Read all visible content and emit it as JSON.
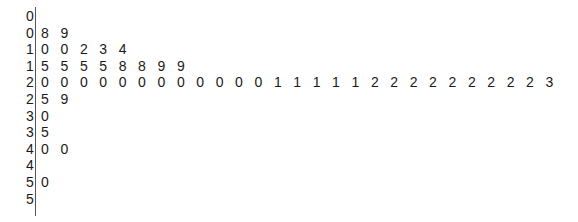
{
  "chart_data": {
    "type": "table",
    "subtype": "stem-and-leaf",
    "title": "",
    "stem_unit": "tens",
    "leaf_unit": "ones",
    "rows": [
      {
        "stem": "0",
        "leaves": []
      },
      {
        "stem": "0",
        "leaves": [
          "8",
          "9"
        ]
      },
      {
        "stem": "1",
        "leaves": [
          "0",
          "0",
          "2",
          "3",
          "4"
        ]
      },
      {
        "stem": "1",
        "leaves": [
          "5",
          "5",
          "5",
          "5",
          "8",
          "8",
          "9",
          "9"
        ]
      },
      {
        "stem": "2",
        "leaves": [
          "0",
          "0",
          "0",
          "0",
          "0",
          "0",
          "0",
          "0",
          "0",
          "0",
          "0",
          "0",
          "1",
          "1",
          "1",
          "1",
          "1",
          "2",
          "2",
          "2",
          "2",
          "2",
          "2",
          "2",
          "2",
          "2",
          "3"
        ]
      },
      {
        "stem": "2",
        "leaves": [
          "5",
          "9"
        ]
      },
      {
        "stem": "3",
        "leaves": [
          "0"
        ]
      },
      {
        "stem": "3",
        "leaves": [
          "5"
        ]
      },
      {
        "stem": "4",
        "leaves": [
          "0",
          "0"
        ]
      },
      {
        "stem": "4",
        "leaves": []
      },
      {
        "stem": "5",
        "leaves": [
          "0"
        ]
      },
      {
        "stem": "5",
        "leaves": []
      }
    ],
    "values": [
      8,
      9,
      10,
      10,
      12,
      13,
      14,
      15,
      15,
      15,
      15,
      18,
      18,
      19,
      19,
      20,
      20,
      20,
      20,
      20,
      20,
      20,
      20,
      20,
      20,
      20,
      20,
      21,
      21,
      21,
      21,
      21,
      22,
      22,
      22,
      22,
      22,
      22,
      22,
      22,
      22,
      23,
      25,
      29,
      30,
      35,
      40,
      40,
      50
    ]
  },
  "layout": {
    "stem_x": 27,
    "first_leaf_x": 39,
    "leaf_pitch": 19.4,
    "first_row_top": 8,
    "row_pitch": 16.6
  }
}
